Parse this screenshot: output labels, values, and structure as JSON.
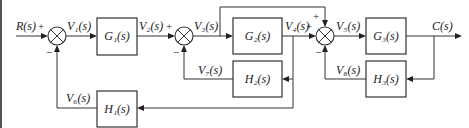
{
  "diagram": {
    "type": "block-diagram",
    "input": "R(s)",
    "output": "C(s)",
    "blocks": {
      "G1": "G₁(s)",
      "G2": "G₂(s)",
      "G3": "G₃(s)",
      "H1": "H₁(s)",
      "H2": "H₂(s)",
      "H3": "H₃(s)"
    },
    "signals": {
      "R": "R(s)",
      "V1": "V₁(s)",
      "V2": "V₂(s)",
      "V3": "V₃(s)",
      "V4": "V₄(s)",
      "V5": "V₅(s)",
      "V6": "V₆(s)",
      "V7": "V₇(s)",
      "V8": "V₈(s)",
      "C": "C(s)"
    },
    "signs": {
      "s1_in": "+",
      "s1_fb": "−",
      "s2_in": "+",
      "s2_fb": "−",
      "s3_in": "+",
      "s3_top": "+",
      "s3_fb": "−"
    }
  }
}
